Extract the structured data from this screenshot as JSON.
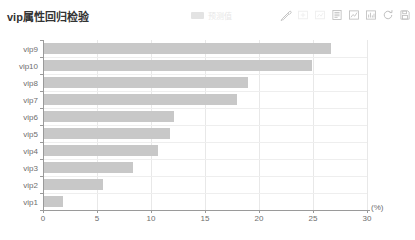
{
  "header": {
    "title": "vip属性回归检验",
    "legend": {
      "label": "预测值",
      "marker_color": "#e3e3e3"
    },
    "toolbox": [
      {
        "name": "brush-icon",
        "label": "区域缩放",
        "faint": false
      },
      {
        "name": "zoom-restore-icon",
        "label": "区域缩放还原",
        "faint": true
      },
      {
        "name": "magic-type-icon",
        "label": "切换类型",
        "faint": true
      },
      {
        "name": "data-view-icon",
        "label": "数据视图",
        "faint": false
      },
      {
        "name": "line-chart-icon",
        "label": "切换为折线图",
        "faint": false
      },
      {
        "name": "bar-chart-icon",
        "label": "切换为柱状图",
        "faint": false
      },
      {
        "name": "restore-icon",
        "label": "还原",
        "faint": false
      },
      {
        "name": "save-image-icon",
        "label": "保存为图片",
        "faint": false
      }
    ]
  },
  "chart_data": {
    "type": "bar",
    "orientation": "horizontal",
    "title": "vip属性回归检验",
    "xlabel": "(%)",
    "ylabel": "",
    "xlim": [
      0,
      30
    ],
    "xticks": [
      0,
      5,
      10,
      15,
      20,
      25,
      30
    ],
    "grid": true,
    "legend_position": "top-center",
    "bar_color": "#c8c8c8",
    "categories": [
      "vip9",
      "vip10",
      "vip8",
      "vip7",
      "vip6",
      "vip5",
      "vip4",
      "vip3",
      "vip2",
      "vip1"
    ],
    "series": [
      {
        "name": "预测值",
        "values": [
          26.6,
          24.8,
          18.9,
          17.9,
          12.0,
          11.7,
          10.6,
          8.2,
          5.5,
          1.8
        ]
      }
    ]
  }
}
